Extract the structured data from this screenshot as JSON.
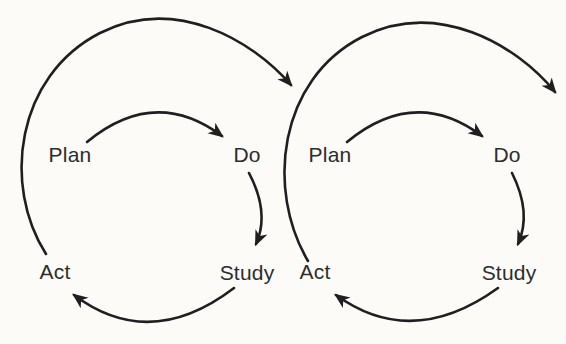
{
  "diagram": {
    "name": "Repeated PDSA improvement cycles",
    "background_color": "#fcfbf8",
    "line_color": "#1f1f1f",
    "text_color": "#2d2d2d",
    "cycles": [
      {
        "id": "cycle-1",
        "steps": {
          "plan": "Plan",
          "do": "Do",
          "study": "Study",
          "act": "Act"
        }
      },
      {
        "id": "cycle-2",
        "steps": {
          "plan": "Plan",
          "do": "Do",
          "study": "Study",
          "act": "Act"
        }
      }
    ],
    "connections": [
      {
        "cycle": 1,
        "from": "Plan",
        "to": "Do",
        "style": "inner arc"
      },
      {
        "cycle": 1,
        "from": "Do",
        "to": "Study",
        "style": "inner arc"
      },
      {
        "cycle": 1,
        "from": "Study",
        "to": "Act",
        "style": "inner arc"
      },
      {
        "cycle": 1,
        "from": "Act",
        "to": "cycle 2",
        "style": "large outer arc"
      },
      {
        "cycle": 2,
        "from": "Plan",
        "to": "Do",
        "style": "inner arc"
      },
      {
        "cycle": 2,
        "from": "Do",
        "to": "Study",
        "style": "inner arc"
      },
      {
        "cycle": 2,
        "from": "Study",
        "to": "Act",
        "style": "inner arc"
      },
      {
        "cycle": 2,
        "from": "Act",
        "to": "next cycle off right edge",
        "style": "large outer arc"
      }
    ]
  }
}
